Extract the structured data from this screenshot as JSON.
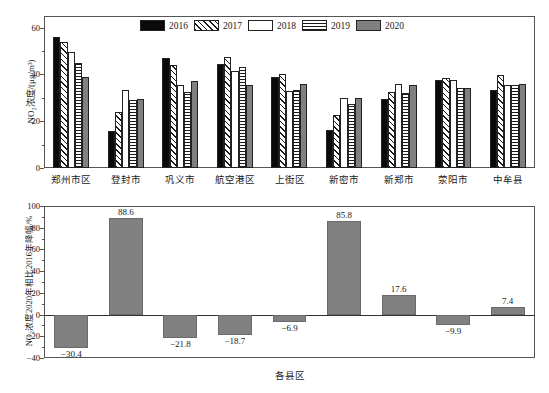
{
  "figure": {
    "background": "#ffffff",
    "bar_gray": "#808080",
    "bar_black": "#0a0a0a"
  },
  "chart_data": [
    {
      "type": "bar",
      "id": "no2-concentration-by-district",
      "title": "",
      "xlabel": "",
      "ylabel": "NO₂浓度/(μg/m³)",
      "ylim": [
        0,
        65
      ],
      "yticks": [
        0,
        20,
        40,
        60
      ],
      "ytick_labels": [
        "0",
        "20",
        "40",
        "60"
      ],
      "grid": false,
      "legend_position": "top-center",
      "categories": [
        "郑州市区",
        "登封市",
        "巩义市",
        "航空港区",
        "上街区",
        "新密市",
        "新郑市",
        "荥阳市",
        "中牟县"
      ],
      "series": [
        {
          "name": "2016",
          "pattern": "solid-black",
          "values": [
            56.0,
            15.7,
            47.2,
            44.3,
            38.9,
            16.1,
            29.4,
            37.6,
            33.4
          ]
        },
        {
          "name": "2017",
          "pattern": "diagonal-hatch",
          "values": [
            53.8,
            24.0,
            44.2,
            47.4,
            40.4,
            22.7,
            32.5,
            38.6,
            39.6
          ]
        },
        {
          "name": "2018",
          "pattern": "empty-white",
          "values": [
            49.8,
            33.3,
            35.7,
            41.6,
            32.8,
            30.1,
            36.0,
            37.7,
            35.7
          ]
        },
        {
          "name": "2019",
          "pattern": "horizontal-lines",
          "values": [
            45.0,
            29.1,
            32.3,
            43.3,
            33.2,
            27.3,
            32.1,
            34.3,
            35.6
          ]
        },
        {
          "name": "2020",
          "pattern": "solid-gray",
          "values": [
            38.9,
            29.6,
            37.0,
            35.6,
            35.9,
            29.9,
            35.7,
            34.0,
            35.8
          ]
        }
      ]
    },
    {
      "type": "bar",
      "id": "no2-change-2020-vs-2016",
      "title": "",
      "xlabel": "各县区",
      "ylabel": "NO₂浓度2020年相比2016年降幅/%",
      "ylim": [
        -40,
        100
      ],
      "yticks": [
        -40,
        -20,
        0,
        20,
        40,
        60,
        80,
        100
      ],
      "ytick_labels": [
        "−40",
        "−20",
        "0",
        "20",
        "40",
        "60",
        "80",
        "100"
      ],
      "grid": false,
      "categories": [
        "郑州市区",
        "登封市",
        "巩义市",
        "航空港区",
        "上街区",
        "新密市",
        "新郑市",
        "荥阳市",
        "中牟县"
      ],
      "values": [
        -30.4,
        88.6,
        -21.8,
        -18.7,
        -6.9,
        85.8,
        17.6,
        -9.9,
        7.4
      ],
      "data_labels": [
        "−30.4",
        "88.6",
        "−21.8",
        "−18.7",
        "−6.9",
        "85.8",
        "17.6",
        "−9.9",
        "7.4"
      ]
    }
  ],
  "legend": {
    "items": [
      {
        "label": "2016"
      },
      {
        "label": "2017"
      },
      {
        "label": "2018"
      },
      {
        "label": "2019"
      },
      {
        "label": "2020"
      }
    ]
  }
}
